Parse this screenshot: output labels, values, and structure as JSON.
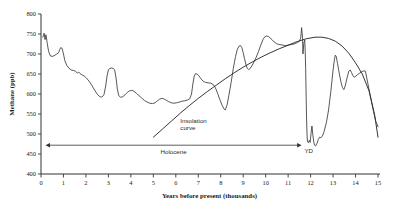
{
  "chart_data": {
    "type": "line",
    "title": "",
    "xlabel": "Years before present (thousands)",
    "ylabel": "Methane (ppb)",
    "xlim": [
      0,
      15
    ],
    "ylim": [
      400,
      800
    ],
    "xticks": [
      0,
      1,
      2,
      3,
      4,
      5,
      6,
      7,
      8,
      9,
      10,
      11,
      12,
      13,
      14,
      15
    ],
    "yticks": [
      400,
      450,
      500,
      550,
      600,
      650,
      700,
      750,
      800
    ],
    "xtick_labels": [
      "0",
      "1",
      "2",
      "3",
      "4",
      "5",
      "6",
      "7",
      "8",
      "9",
      "10",
      "11",
      "12",
      "13",
      "14",
      "15"
    ],
    "ytick_labels": [
      "400",
      "450",
      "500",
      "550",
      "600",
      "650",
      "700",
      "750",
      "800"
    ],
    "grid": false,
    "legend": "none",
    "axis_direction_note": "x increases left to right as years before present",
    "series": [
      {
        "name": "Methane concentration",
        "color": "#3a3a3a",
        "points": [
          [
            0.08,
            742
          ],
          [
            0.14,
            752
          ],
          [
            0.18,
            736
          ],
          [
            0.22,
            748
          ],
          [
            0.28,
            726
          ],
          [
            0.34,
            706
          ],
          [
            0.42,
            695
          ],
          [
            0.52,
            694
          ],
          [
            0.62,
            697
          ],
          [
            0.7,
            700
          ],
          [
            0.78,
            703
          ],
          [
            0.84,
            712
          ],
          [
            0.88,
            716
          ],
          [
            0.94,
            714
          ],
          [
            1.0,
            700
          ],
          [
            1.06,
            684
          ],
          [
            1.14,
            672
          ],
          [
            1.24,
            665
          ],
          [
            1.34,
            660
          ],
          [
            1.44,
            659
          ],
          [
            1.54,
            657
          ],
          [
            1.62,
            652
          ],
          [
            1.68,
            655
          ],
          [
            1.74,
            651
          ],
          [
            1.82,
            648
          ],
          [
            1.92,
            645
          ],
          [
            2.02,
            640
          ],
          [
            2.14,
            632
          ],
          [
            2.26,
            622
          ],
          [
            2.38,
            610
          ],
          [
            2.5,
            600
          ],
          [
            2.6,
            594
          ],
          [
            2.7,
            592
          ],
          [
            2.8,
            598
          ],
          [
            2.88,
            620
          ],
          [
            2.94,
            645
          ],
          [
            3.0,
            660
          ],
          [
            3.06,
            664
          ],
          [
            3.14,
            665
          ],
          [
            3.22,
            664
          ],
          [
            3.28,
            660
          ],
          [
            3.34,
            640
          ],
          [
            3.4,
            612
          ],
          [
            3.46,
            596
          ],
          [
            3.54,
            592
          ],
          [
            3.64,
            593
          ],
          [
            3.74,
            598
          ],
          [
            3.84,
            604
          ],
          [
            3.94,
            608
          ],
          [
            4.04,
            609
          ],
          [
            4.14,
            607
          ],
          [
            4.24,
            602
          ],
          [
            4.36,
            596
          ],
          [
            4.48,
            590
          ],
          [
            4.6,
            584
          ],
          [
            4.72,
            580
          ],
          [
            4.84,
            577
          ],
          [
            4.96,
            576
          ],
          [
            5.08,
            578
          ],
          [
            5.18,
            583
          ],
          [
            5.28,
            587
          ],
          [
            5.38,
            589
          ],
          [
            5.46,
            588
          ],
          [
            5.56,
            585
          ],
          [
            5.68,
            581
          ],
          [
            5.8,
            578
          ],
          [
            5.92,
            577
          ],
          [
            6.04,
            578
          ],
          [
            6.16,
            580
          ],
          [
            6.28,
            582
          ],
          [
            6.4,
            583
          ],
          [
            6.52,
            585
          ],
          [
            6.62,
            588
          ],
          [
            6.7,
            600
          ],
          [
            6.76,
            625
          ],
          [
            6.82,
            645
          ],
          [
            6.88,
            651
          ],
          [
            6.94,
            650
          ],
          [
            7.02,
            646
          ],
          [
            7.12,
            638
          ],
          [
            7.22,
            632
          ],
          [
            7.32,
            629
          ],
          [
            7.44,
            628
          ],
          [
            7.56,
            627
          ],
          [
            7.66,
            624
          ],
          [
            7.76,
            616
          ],
          [
            7.86,
            602
          ],
          [
            7.96,
            586
          ],
          [
            8.06,
            572
          ],
          [
            8.14,
            563
          ],
          [
            8.2,
            560
          ],
          [
            8.28,
            572
          ],
          [
            8.36,
            596
          ],
          [
            8.46,
            628
          ],
          [
            8.56,
            664
          ],
          [
            8.66,
            694
          ],
          [
            8.74,
            712
          ],
          [
            8.82,
            720
          ],
          [
            8.88,
            721
          ],
          [
            8.94,
            716
          ],
          [
            9.0,
            703
          ],
          [
            9.06,
            688
          ],
          [
            9.12,
            674
          ],
          [
            9.18,
            664
          ],
          [
            9.24,
            661
          ],
          [
            9.3,
            663
          ],
          [
            9.38,
            670
          ],
          [
            9.48,
            680
          ],
          [
            9.58,
            692
          ],
          [
            9.68,
            706
          ],
          [
            9.78,
            722
          ],
          [
            9.88,
            736
          ],
          [
            9.96,
            743
          ],
          [
            10.04,
            745
          ],
          [
            10.12,
            744
          ],
          [
            10.2,
            740
          ],
          [
            10.28,
            736
          ],
          [
            10.38,
            730
          ],
          [
            10.48,
            726
          ],
          [
            10.58,
            724
          ],
          [
            10.68,
            723
          ],
          [
            10.78,
            722
          ],
          [
            10.88,
            721
          ],
          [
            10.98,
            722
          ],
          [
            11.08,
            723
          ],
          [
            11.2,
            724
          ],
          [
            11.32,
            726
          ],
          [
            11.42,
            729
          ],
          [
            11.5,
            732
          ],
          [
            11.56,
            740
          ],
          [
            11.6,
            766
          ],
          [
            11.64,
            742
          ],
          [
            11.66,
            700
          ],
          [
            11.7,
            728
          ],
          [
            11.74,
            735
          ],
          [
            11.76,
            706
          ],
          [
            11.78,
            664
          ],
          [
            11.8,
            600
          ],
          [
            11.82,
            540
          ],
          [
            11.84,
            500
          ],
          [
            11.86,
            482
          ],
          [
            11.9,
            478
          ],
          [
            11.94,
            484
          ],
          [
            11.98,
            479
          ],
          [
            12.02,
            502
          ],
          [
            12.06,
            520
          ],
          [
            12.1,
            498
          ],
          [
            12.14,
            480
          ],
          [
            12.18,
            472
          ],
          [
            12.22,
            470
          ],
          [
            12.28,
            476
          ],
          [
            12.34,
            486
          ],
          [
            12.4,
            492
          ],
          [
            12.46,
            491
          ],
          [
            12.52,
            494
          ],
          [
            12.6,
            506
          ],
          [
            12.7,
            528
          ],
          [
            12.8,
            560
          ],
          [
            12.9,
            606
          ],
          [
            13.0,
            660
          ],
          [
            13.06,
            686
          ],
          [
            13.1,
            697
          ],
          [
            13.14,
            694
          ],
          [
            13.2,
            676
          ],
          [
            13.28,
            650
          ],
          [
            13.36,
            628
          ],
          [
            13.42,
            616
          ],
          [
            13.48,
            611
          ],
          [
            13.54,
            620
          ],
          [
            13.62,
            640
          ],
          [
            13.7,
            657
          ],
          [
            13.76,
            660
          ],
          [
            13.82,
            654
          ],
          [
            13.88,
            646
          ],
          [
            13.94,
            642
          ],
          [
            14.0,
            644
          ],
          [
            14.08,
            648
          ],
          [
            14.18,
            652
          ],
          [
            14.28,
            656
          ],
          [
            14.38,
            658
          ],
          [
            14.44,
            657
          ],
          [
            14.5,
            640
          ],
          [
            14.6,
            612
          ],
          [
            14.7,
            584
          ],
          [
            14.8,
            556
          ],
          [
            14.9,
            532
          ],
          [
            15.0,
            518
          ]
        ]
      },
      {
        "name": "Insolation curve",
        "color": "#2b2b2b",
        "points": [
          [
            5.0,
            492
          ],
          [
            5.4,
            512
          ],
          [
            5.8,
            532
          ],
          [
            6.2,
            552
          ],
          [
            6.6,
            571
          ],
          [
            7.0,
            589
          ],
          [
            7.4,
            606
          ],
          [
            7.8,
            622
          ],
          [
            8.2,
            638
          ],
          [
            8.6,
            653
          ],
          [
            9.0,
            667
          ],
          [
            9.4,
            680
          ],
          [
            9.8,
            692
          ],
          [
            10.2,
            703
          ],
          [
            10.6,
            713
          ],
          [
            11.0,
            722
          ],
          [
            11.4,
            731
          ],
          [
            11.8,
            738
          ],
          [
            12.2,
            742
          ],
          [
            12.5,
            742
          ],
          [
            12.8,
            739
          ],
          [
            13.1,
            732
          ],
          [
            13.4,
            720
          ],
          [
            13.7,
            702
          ],
          [
            14.0,
            678
          ],
          [
            14.3,
            650
          ],
          [
            14.6,
            608
          ],
          [
            14.85,
            548
          ],
          [
            15.0,
            492
          ]
        ]
      }
    ],
    "annotations": [
      {
        "id": "insolation-label",
        "text_lines": [
          "Insolation",
          "curve"
        ],
        "x": 6.2,
        "y": 528
      },
      {
        "id": "holocene-span",
        "text": "Holocene",
        "x_start": 0.2,
        "x_end": 11.6,
        "y": 472,
        "style": "double-headed-arrow"
      },
      {
        "id": "younger-dryas-label",
        "text": "YD",
        "x": 11.92,
        "y": 452
      }
    ]
  }
}
